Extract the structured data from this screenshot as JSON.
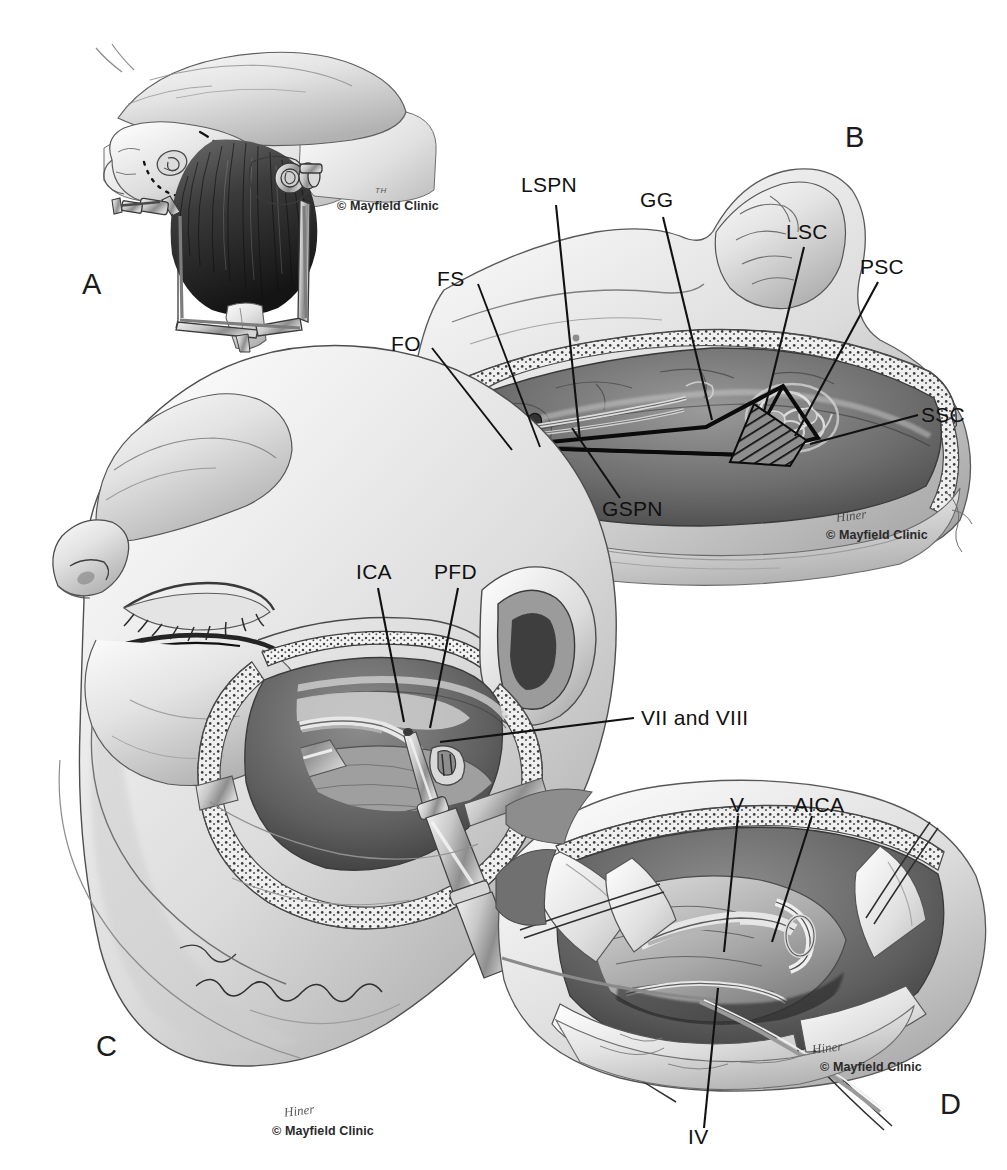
{
  "figure": {
    "type": "surgical-anatomy-illustration",
    "style": "grayscale pencil/graphite medical illustration",
    "panel_count": 4
  },
  "panels": [
    {
      "id": "A",
      "letter": "A",
      "caption_text": "",
      "description": "Patient positioning: head in three-pin Mayfield skull clamp, lateral park-bench position with planned incision marked by dashed line over the temporal/retroauricular scalp",
      "labels": [],
      "credit": "© Mayfield Clinic",
      "artist_mark": "TH"
    },
    {
      "id": "B",
      "letter": "B",
      "caption_text": "",
      "description": "Middle fossa floor exposure showing the rhomboid (Kawase) triangle outlined in black with hatched drill-out area, petrous apex and semicircular canals",
      "labels": [
        {
          "key": "LSPN",
          "text": "LSPN",
          "meaning": "lesser superficial petrosal nerve"
        },
        {
          "key": "GG",
          "text": "GG",
          "meaning": "geniculate ganglion"
        },
        {
          "key": "LSC",
          "text": "LSC",
          "meaning": "lateral semicircular canal"
        },
        {
          "key": "PSC",
          "text": "PSC",
          "meaning": "posterior semicircular canal"
        },
        {
          "key": "SSC",
          "text": "SSC",
          "meaning": "superior semicircular canal"
        },
        {
          "key": "FS",
          "text": "FS",
          "meaning": "foramen spinosum"
        },
        {
          "key": "FO",
          "text": "FO",
          "meaning": "foramen ovale"
        },
        {
          "key": "GSPN",
          "text": "GSPN",
          "meaning": "greater superficial petrosal nerve"
        }
      ],
      "credit": "© Mayfield Clinic"
    },
    {
      "id": "C",
      "letter": "C",
      "caption_text": "",
      "description": "Lateral view of the head with combined petrosal craniotomy, retractors in place and high-speed drill working in the petrous bone",
      "labels": [
        {
          "key": "ICA",
          "text": "ICA",
          "meaning": "internal carotid artery"
        },
        {
          "key": "PFD",
          "text": "PFD",
          "meaning": "posterior fossa dura"
        },
        {
          "key": "VII_VIII",
          "text": "VII and VIII",
          "meaning": "facial and vestibulocochlear nerves"
        }
      ],
      "credit": "© Mayfield Clinic"
    },
    {
      "id": "D",
      "letter": "D",
      "caption_text": "",
      "description": "Intradural view through the opened petrosal corridor with dural flaps retracted by stay sutures, exposing the cerebellopontine angle",
      "labels": [
        {
          "key": "V",
          "text": "V",
          "meaning": "trigeminal nerve"
        },
        {
          "key": "AICA",
          "text": "AICA",
          "meaning": "anterior inferior cerebellar artery"
        },
        {
          "key": "IV",
          "text": "IV",
          "meaning": "trochlear nerve"
        }
      ],
      "credit": "© Mayfield Clinic"
    }
  ],
  "colors": {
    "background": "#ffffff",
    "ink": "#111111",
    "tone_light": "#e9e9e9",
    "tone_mid": "#b6b6b6",
    "tone_dark": "#6f6f6f",
    "tone_deep": "#3a3a3a"
  }
}
